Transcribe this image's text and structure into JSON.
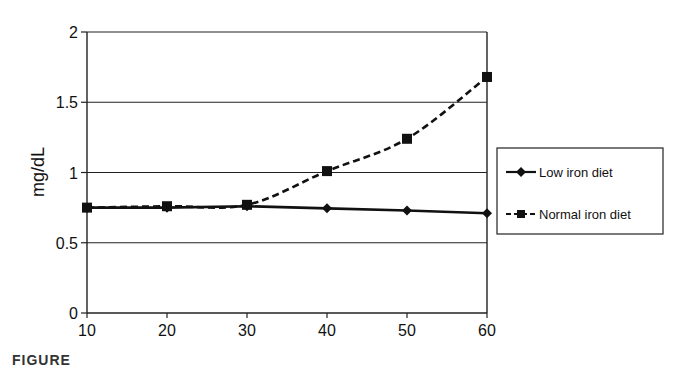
{
  "chart_data": {
    "type": "line",
    "title": "",
    "xlabel": "",
    "ylabel": "mg/dL",
    "x": [
      10,
      20,
      30,
      40,
      50,
      60
    ],
    "xlim": [
      10,
      60
    ],
    "ylim": [
      0,
      2
    ],
    "x_ticks": [
      "10",
      "20",
      "30",
      "40",
      "50",
      "60"
    ],
    "y_ticks": [
      "0",
      "0.5",
      "1",
      "1.5",
      "2"
    ],
    "grid": "horizontal",
    "legend_position": "right",
    "series": [
      {
        "name": "Low iron diet",
        "marker": "diamond",
        "line_style": "solid",
        "values": [
          0.75,
          0.75,
          0.76,
          0.745,
          0.73,
          0.71
        ]
      },
      {
        "name": "Normal iron diet",
        "marker": "square",
        "line_style": "dashed",
        "values": [
          0.75,
          0.76,
          0.77,
          1.01,
          1.24,
          1.68
        ]
      }
    ]
  },
  "legend": {
    "items": [
      {
        "label": "Low iron diet"
      },
      {
        "label": "Normal iron diet"
      }
    ]
  },
  "caption_fragment": "FIGURE"
}
